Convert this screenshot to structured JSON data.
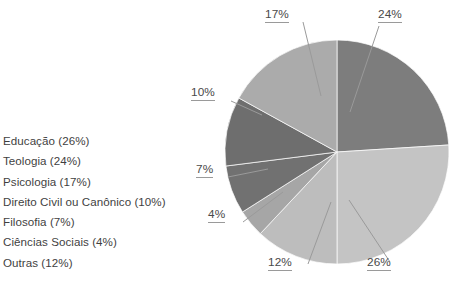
{
  "chart_data": {
    "type": "pie",
    "title": "",
    "categories": [
      "Educação",
      "Teologia",
      "Psicologia",
      "Direito Civil ou Canônico",
      "Filosofia",
      "Ciências Sociais",
      "Outras"
    ],
    "values": [
      26,
      24,
      17,
      10,
      7,
      4,
      12
    ],
    "unit": "%",
    "legend_position": "left",
    "grid": false,
    "start_angle_deg": 0,
    "direction": "clockwise",
    "slice_order_clockwise_from_top": [
      "Teologia",
      "Educação",
      "Outras",
      "Ciências Sociais",
      "Filosofia",
      "Direito Civil ou Canônico",
      "Psicologia"
    ],
    "colors": {
      "Teologia": "#7d7d7d",
      "Educação": "#c4c4c4",
      "Outras": "#bdbdbd",
      "Ciências Sociais": "#a6a6a6",
      "Filosofia": "#717171",
      "Direito Civil ou Canônico": "#6e6e6e",
      "Psicologia": "#ababab"
    },
    "data_labels": [
      "24%",
      "26%",
      "12%",
      "4%",
      "7%",
      "10%",
      "17%"
    ]
  },
  "legend": {
    "items": [
      {
        "label": "Educação (26%)"
      },
      {
        "label": "Teologia (24%)"
      },
      {
        "label": "Psicologia (17%)"
      },
      {
        "label": "Direito Civil ou Canônico (10%)"
      },
      {
        "label": "Filosofia (7%)"
      },
      {
        "label": "Ciências Sociais (4%)"
      },
      {
        "label": "Outras (12%)"
      }
    ]
  },
  "pie_labels": {
    "teologia": "24%",
    "educacao": "26%",
    "outras": "12%",
    "ciencias_sociais": "4%",
    "filosofia": "7%",
    "direito": "10%",
    "psicologia": "17%"
  },
  "style": {
    "text_color": "#3f3f3f",
    "label_color": "#4a4a4a",
    "leader_color": "#9a9a9a",
    "background": "#ffffff"
  }
}
